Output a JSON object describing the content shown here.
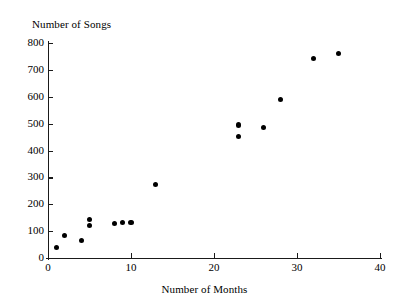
{
  "chart_data": {
    "type": "scatter",
    "title": "",
    "xlabel": "Number of Months",
    "ylabel": "Number of Songs",
    "xlim": [
      0,
      40
    ],
    "ylim": [
      0,
      800
    ],
    "grid": false,
    "legend": null,
    "xticks": [
      0,
      10,
      20,
      30,
      40
    ],
    "yticks": [
      0,
      100,
      200,
      300,
      400,
      500,
      600,
      700,
      800
    ],
    "xtick_labels": [
      "0",
      "10",
      "20",
      "30",
      "40"
    ],
    "ytick_labels": [
      "0",
      "100",
      "200",
      "300",
      "400",
      "500",
      "600",
      "700",
      "800"
    ],
    "marker": "filled-circle",
    "marker_color": "#000000",
    "points": [
      {
        "x": 1,
        "y": 38
      },
      {
        "x": 2,
        "y": 84
      },
      {
        "x": 4,
        "y": 64
      },
      {
        "x": 5,
        "y": 143
      },
      {
        "x": 5,
        "y": 120
      },
      {
        "x": 8,
        "y": 127
      },
      {
        "x": 9,
        "y": 131
      },
      {
        "x": 10,
        "y": 133
      },
      {
        "x": 13,
        "y": 272
      },
      {
        "x": 23,
        "y": 495
      },
      {
        "x": 23,
        "y": 452
      },
      {
        "x": 26,
        "y": 487
      },
      {
        "x": 28,
        "y": 590
      },
      {
        "x": 32,
        "y": 742
      },
      {
        "x": 35,
        "y": 762
      }
    ]
  },
  "axis": {
    "line_color": "#1a1a1a",
    "background": "#ffffff"
  }
}
